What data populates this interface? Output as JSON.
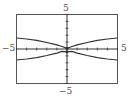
{
  "chart_data": {
    "type": "line",
    "title": "",
    "xlabel": "",
    "ylabel": "",
    "xlim": [
      -5,
      5
    ],
    "ylim": [
      -5,
      5
    ],
    "grid": false,
    "tick_labels": {
      "x_min": "−5",
      "x_max": "5",
      "y_min": "−5",
      "y_max": "5"
    },
    "series": [
      {
        "name": "upper curve",
        "x": [
          -5,
          -4,
          -3,
          -2,
          -1,
          -0.5,
          0,
          0.5,
          1,
          2,
          3,
          4,
          5
        ],
        "y": [
          1.6,
          1.45,
          1.25,
          0.95,
          0.6,
          0.35,
          0.1,
          0.35,
          0.6,
          0.95,
          1.25,
          1.45,
          1.6
        ]
      },
      {
        "name": "lower curve",
        "x": [
          -5,
          -4,
          -3,
          -2,
          -1,
          -0.5,
          0,
          0.5,
          1,
          2,
          3,
          4,
          5
        ],
        "y": [
          -1.6,
          -1.45,
          -1.25,
          -0.95,
          -0.6,
          -0.35,
          -0.4,
          -0.35,
          -0.6,
          -0.95,
          -1.25,
          -1.45,
          -1.6
        ]
      }
    ],
    "colors": {
      "frame": "#555555",
      "curve": "#333333",
      "axis": "#333333"
    }
  }
}
